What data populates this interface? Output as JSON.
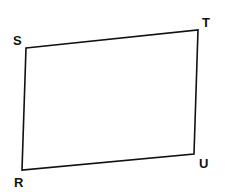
{
  "diagram": {
    "type": "quadrilateral",
    "stroke_color": "#111111",
    "vertices": [
      {
        "label": "S",
        "x": 26,
        "y": 48,
        "label_x": 13,
        "label_y": 45
      },
      {
        "label": "T",
        "x": 198,
        "y": 30,
        "label_x": 202,
        "label_y": 27
      },
      {
        "label": "U",
        "x": 194,
        "y": 154,
        "label_x": 199,
        "label_y": 168
      },
      {
        "label": "R",
        "x": 22,
        "y": 170,
        "label_x": 14,
        "label_y": 187
      }
    ]
  }
}
